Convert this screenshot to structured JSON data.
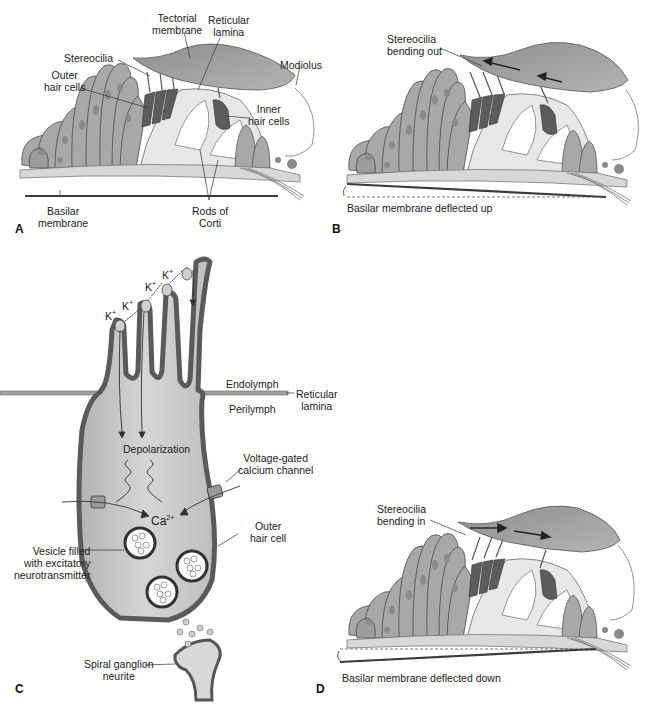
{
  "figure": {
    "panels": [
      {
        "letter": "A",
        "labels": {
          "tectorial_membrane": [
            "Tectorial",
            "membrane"
          ],
          "reticular_lamina": [
            "Reticular",
            "lamina"
          ],
          "modiolus": "Modiolus",
          "stereocilia": "Stereocilia",
          "outer_hair_cells": [
            "Outer",
            "hair cells"
          ],
          "inner_hair_cells": [
            "Inner",
            "hair cells"
          ],
          "basilar_membrane": [
            "Basilar",
            "membrane"
          ],
          "rods_of_corti": [
            "Rods of",
            "Corti"
          ]
        }
      },
      {
        "letter": "B",
        "labels": {
          "stereocilia_state": [
            "Stereocilia",
            "bending out"
          ],
          "basilar_state": "Basilar membrane deflected up"
        }
      },
      {
        "letter": "C",
        "labels": {
          "k_ion": "K+",
          "k_ion_base": "K",
          "k_ion_charge": "+",
          "endolymph": "Endolymph",
          "perilymph": "Perilymph",
          "reticular_lamina": [
            "Reticular",
            "lamina"
          ],
          "depolarization": "Depolarization",
          "voltage_gated": [
            "Voltage-gated",
            "calcium channel"
          ],
          "calcium_base": "Ca",
          "calcium_charge": "2+",
          "outer_hair_cell": [
            "Outer",
            "hair cell"
          ],
          "vesicle": [
            "Vesicle filled",
            "with excitatory",
            "neurotransmitter"
          ],
          "spiral_ganglion": [
            "Spiral ganglion",
            "neurite"
          ]
        }
      },
      {
        "letter": "D",
        "labels": {
          "stereocilia_state": [
            "Stereocilia",
            "bending in"
          ],
          "basilar_state": "Basilar membrane deflected down"
        }
      }
    ],
    "colors": {
      "tissue_fill": "#a9a9a9",
      "tissue_stroke": "#4a4a4a",
      "tectorial_fill": "#9e9e9e",
      "hair_cell_dark": "#5c5c5c",
      "membrane_line": "#3a3a3a",
      "cell_interior": "#c8c8c8",
      "cell_wall": "#5a5a5a"
    }
  }
}
